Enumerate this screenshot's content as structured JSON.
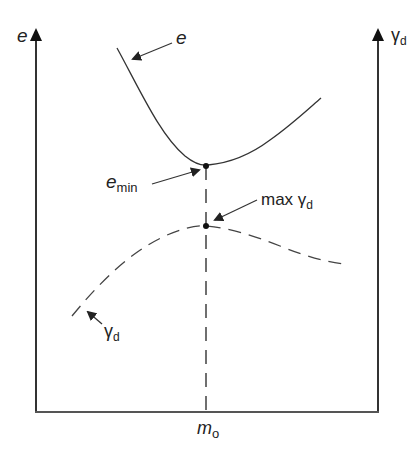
{
  "diagram": {
    "type": "compaction-curve-schematic",
    "left_axis": {
      "symbol": "e",
      "subscript": ""
    },
    "right_axis": {
      "symbol": "γ",
      "subscript": "d"
    },
    "x_axis": {
      "tick_label_symbol": "m",
      "tick_label_subscript": "o"
    },
    "curves": [
      {
        "name": "void ratio curve",
        "label_symbol": "e",
        "label_subscript": "",
        "style": "solid",
        "shape": "U-shaped, minimum at m_o"
      },
      {
        "name": "dry unit weight curve",
        "label_symbol": "γ",
        "label_subscript": "d",
        "style": "dashed",
        "shape": "inverted-U, maximum at m_o"
      }
    ],
    "annotations": [
      {
        "id": "e-min",
        "symbol": "e",
        "subscript": "min"
      },
      {
        "id": "max-gamma-d",
        "prefix": "max ",
        "symbol": "γ",
        "subscript": "d"
      }
    ],
    "colors": {
      "line": "#222222",
      "background": "#ffffff"
    }
  }
}
